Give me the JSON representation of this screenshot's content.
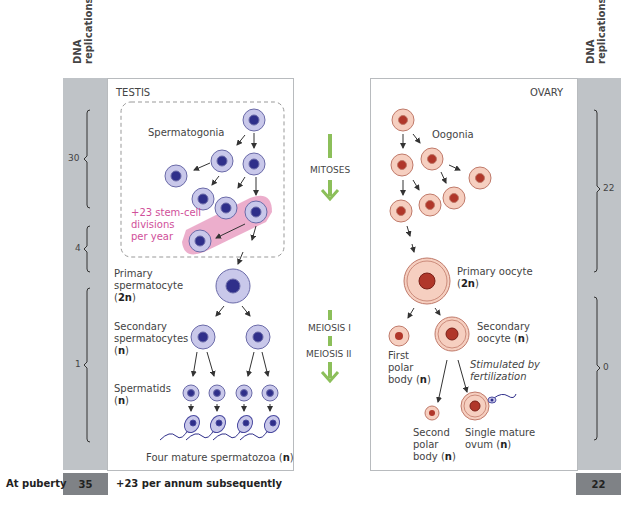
{
  "header": {
    "left_axis_title_1": "DNA",
    "left_axis_title_2": "replications",
    "right_axis_title_1": "DNA",
    "right_axis_title_2": "replications"
  },
  "testis": {
    "title": "TESTIS",
    "spermatogonia": "Spermatogonia",
    "stem_cell_note_1": "+23 stem-cell",
    "stem_cell_note_2": "divisions",
    "stem_cell_note_3": "per year",
    "primary_1": "Primary",
    "primary_2": "spermatocyte",
    "primary_ploidy": "2n",
    "secondary_1": "Secondary",
    "secondary_2": "spermatocytes",
    "secondary_ploidy": "n",
    "spermatids_1": "Spermatids",
    "spermatids_ploidy": "n",
    "mature_text": "Four mature spermatozoa (",
    "mature_ploidy": "n",
    "mature_close": ")"
  },
  "ovary": {
    "title": "OVARY",
    "oogonia": "Oogonia",
    "primary_1": "Primary oocyte",
    "primary_ploidy": "2n",
    "secondary_1": "Secondary",
    "secondary_2": "oocyte (",
    "secondary_ploidy": "n",
    "first_polar_1": "First",
    "first_polar_2": "polar",
    "first_polar_3": "body (",
    "first_polar_ploidy": "n",
    "stimulated_1": "Stimulated by",
    "stimulated_2": "fertilization",
    "second_polar_1": "Second",
    "second_polar_2": "polar",
    "second_polar_3": "body (",
    "second_polar_ploidy": "n",
    "ovum_1": "Single mature",
    "ovum_2": "ovum (",
    "ovum_ploidy": "n"
  },
  "phases": {
    "mitoses": "MITOSES",
    "meiosis1": "MEIOSIS I",
    "meiosis2": "MEIOSIS II"
  },
  "left_brackets": [
    {
      "value": "30"
    },
    {
      "value": "4"
    },
    {
      "value": "1"
    }
  ],
  "right_brackets": [
    {
      "value": "22"
    },
    {
      "value": "0"
    }
  ],
  "footer": {
    "at_puberty": "At puberty",
    "male_total": "35",
    "male_note": "+23 per annum subsequently",
    "female_total": "22"
  },
  "colors": {
    "sperm_cell_fill": "#c9c8ea",
    "sperm_nucleus": "#2f2f8a",
    "egg_cell_fill": "#f6cfc0",
    "egg_nucleus": "#b0372a",
    "stem_highlight": "#e9a0c3",
    "stem_text": "#d0509a",
    "phase_arrow": "#8cbf5a",
    "gray_column": "#bfc3c7",
    "dark_cell": "#7f8286"
  }
}
